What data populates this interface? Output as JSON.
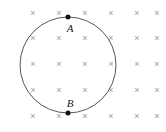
{
  "figure": {
    "background_color": "#ffffff",
    "width": 166,
    "height": 132,
    "field": {
      "symbol": "×",
      "icon_name": "field-into-page-cross",
      "color": "#9a9a9a",
      "columns": 6,
      "rows": 5,
      "marks": [
        {
          "x": 33,
          "y": 13
        },
        {
          "x": 59,
          "y": 13
        },
        {
          "x": 85,
          "y": 13
        },
        {
          "x": 111,
          "y": 13
        },
        {
          "x": 137,
          "y": 13
        },
        {
          "x": 157,
          "y": 13
        },
        {
          "x": 33,
          "y": 38
        },
        {
          "x": 59,
          "y": 38
        },
        {
          "x": 85,
          "y": 38
        },
        {
          "x": 111,
          "y": 38
        },
        {
          "x": 137,
          "y": 38
        },
        {
          "x": 157,
          "y": 38
        },
        {
          "x": 33,
          "y": 64
        },
        {
          "x": 59,
          "y": 64
        },
        {
          "x": 85,
          "y": 64
        },
        {
          "x": 111,
          "y": 64
        },
        {
          "x": 137,
          "y": 64
        },
        {
          "x": 157,
          "y": 64
        },
        {
          "x": 33,
          "y": 90
        },
        {
          "x": 59,
          "y": 90
        },
        {
          "x": 85,
          "y": 90
        },
        {
          "x": 111,
          "y": 90
        },
        {
          "x": 137,
          "y": 90
        },
        {
          "x": 157,
          "y": 90
        },
        {
          "x": 33,
          "y": 116
        },
        {
          "x": 59,
          "y": 116
        },
        {
          "x": 85,
          "y": 116
        },
        {
          "x": 111,
          "y": 116
        },
        {
          "x": 137,
          "y": 116
        },
        {
          "x": 157,
          "y": 116
        }
      ]
    },
    "loop": {
      "shape": "circle",
      "center_x": 68,
      "center_y": 65,
      "radius": 48,
      "stroke_color": "#555555",
      "stroke_width": 1
    },
    "points": [
      {
        "id": "A",
        "label": "A",
        "dot_x": 68,
        "dot_y": 17,
        "label_x": 70,
        "label_y": 28,
        "dot_color": "#111111"
      },
      {
        "id": "B",
        "label": "B",
        "dot_x": 68,
        "dot_y": 113,
        "label_x": 70,
        "label_y": 103,
        "dot_color": "#111111"
      }
    ]
  }
}
